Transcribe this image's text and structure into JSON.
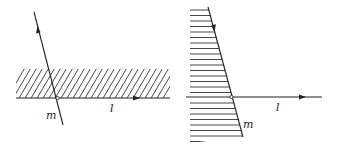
{
  "figure": {
    "left_panel": {
      "line_l_label": "l",
      "line_m_label": "m",
      "region": "half-plane strip above l, hatched diagonally",
      "intersection_point": "open circle"
    },
    "right_panel": {
      "line_l_label": "l",
      "line_m_label": "m",
      "region": "half-plane left of m, hatched horizontally",
      "intersection_point": "open circle"
    },
    "colors": {
      "stroke": "#222222",
      "background": "#ffffff"
    }
  }
}
